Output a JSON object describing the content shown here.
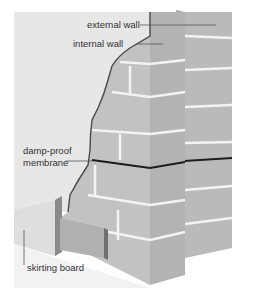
{
  "diagram": {
    "labels": {
      "external_wall": "external wall",
      "internal_wall": "internal wall",
      "damp_proof_line1": "damp-proof",
      "damp_proof_line2": "membrane",
      "skirting_board": "skirting board"
    },
    "colors": {
      "plaster": "#e6e6e6",
      "brick_face": "#bdbdbd",
      "brick_side": "#a8a8a8",
      "mortar": "#f4f4f4",
      "membrane": "#222222",
      "leader_line": "#555555",
      "text": "#333333"
    }
  }
}
